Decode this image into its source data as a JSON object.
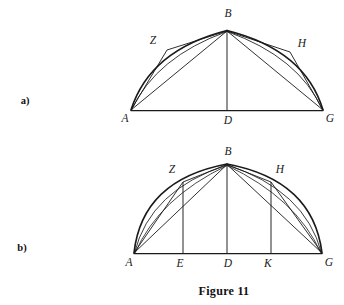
{
  "figure": {
    "caption": "Figure 11",
    "caption_position": {
      "x": 224,
      "y": 291
    },
    "background_color": "#ffffff",
    "ink_color": "#1a1a1a",
    "panels": [
      {
        "id": "a",
        "label": "a)",
        "label_position": {
          "x": 25,
          "y": 101
        },
        "description": "Circular segment on base AG with apex B; chords AZ, ZB, AB on the left and BH, HG, BG on the right, plus the vertical radius BD.",
        "geometry": {
          "baseline_y": 110,
          "apex_y": 30,
          "points": {
            "A": {
              "x": 131,
              "y": 110
            },
            "G": {
              "x": 323,
              "y": 110
            },
            "B": {
              "x": 227,
              "y": 30
            },
            "D": {
              "x": 227,
              "y": 110
            },
            "Z": {
              "x": 167,
              "y": 50
            },
            "H": {
              "x": 290,
              "y": 52
            }
          },
          "label_offsets": {
            "A": {
              "x": 125,
              "y": 119
            },
            "G": {
              "x": 330,
              "y": 119
            },
            "B": {
              "x": 228,
              "y": 14
            },
            "D": {
              "x": 228,
              "y": 121
            },
            "Z": {
              "x": 153,
              "y": 41
            },
            "H": {
              "x": 302,
              "y": 44
            }
          },
          "segments": [
            {
              "name": "base-AG",
              "from": "A",
              "to": "G"
            },
            {
              "name": "chord-AB",
              "from": "A",
              "to": "B"
            },
            {
              "name": "chord-BG",
              "from": "B",
              "to": "G"
            },
            {
              "name": "chord-AZ",
              "from": "A",
              "to": "Z"
            },
            {
              "name": "chord-ZB",
              "from": "Z",
              "to": "B"
            },
            {
              "name": "chord-BH",
              "from": "B",
              "to": "H"
            },
            {
              "name": "chord-HG",
              "from": "H",
              "to": "G"
            },
            {
              "name": "radius-BD",
              "from": "B",
              "to": "D"
            }
          ],
          "arcs": [
            {
              "name": "arc-AZB",
              "from": "A",
              "through": "Z",
              "to": "B"
            },
            {
              "name": "arc-BHG",
              "from": "B",
              "through": "H",
              "to": "G"
            }
          ],
          "verticals": []
        }
      },
      {
        "id": "b",
        "label": "b)",
        "label_position": {
          "x": 22,
          "y": 248
        },
        "description": "Same circular segment on base AG with apex B, with the added perpendiculars ZE and HK dropped to the base and extra chords from A and G.",
        "geometry": {
          "baseline_y": 253,
          "apex_y": 163,
          "points": {
            "A": {
              "x": 134,
              "y": 253
            },
            "G": {
              "x": 322,
              "y": 253
            },
            "B": {
              "x": 227,
              "y": 163
            },
            "D": {
              "x": 227,
              "y": 253
            },
            "Z": {
              "x": 183,
              "y": 182
            },
            "H": {
              "x": 271,
              "y": 182
            },
            "E": {
              "x": 183,
              "y": 253
            },
            "K": {
              "x": 271,
              "y": 253
            }
          },
          "label_offsets": {
            "A": {
              "x": 129,
              "y": 263
            },
            "G": {
              "x": 329,
              "y": 263
            },
            "B": {
              "x": 228,
              "y": 152
            },
            "D": {
              "x": 228,
              "y": 264
            },
            "Z": {
              "x": 172,
              "y": 170
            },
            "H": {
              "x": 280,
              "y": 170
            },
            "E": {
              "x": 180,
              "y": 264
            },
            "K": {
              "x": 268,
              "y": 264
            }
          },
          "segments": [
            {
              "name": "base-AG",
              "from": "A",
              "to": "G"
            },
            {
              "name": "chord-AB",
              "from": "A",
              "to": "B"
            },
            {
              "name": "chord-BG",
              "from": "B",
              "to": "G"
            },
            {
              "name": "chord-AZ",
              "from": "A",
              "to": "Z"
            },
            {
              "name": "chord-ZB",
              "from": "Z",
              "to": "B"
            },
            {
              "name": "chord-BH",
              "from": "B",
              "to": "H"
            },
            {
              "name": "chord-HG",
              "from": "H",
              "to": "G"
            },
            {
              "name": "radius-BD",
              "from": "B",
              "to": "D"
            }
          ],
          "arcs": [
            {
              "name": "arc-AZB",
              "from": "A",
              "through": "Z",
              "to": "B"
            },
            {
              "name": "arc-BHG",
              "from": "B",
              "through": "H",
              "to": "G"
            }
          ],
          "verticals": [
            {
              "name": "perpendicular-ZE",
              "from": "Z",
              "to": "E"
            },
            {
              "name": "perpendicular-HK",
              "from": "H",
              "to": "K"
            }
          ]
        }
      }
    ]
  }
}
